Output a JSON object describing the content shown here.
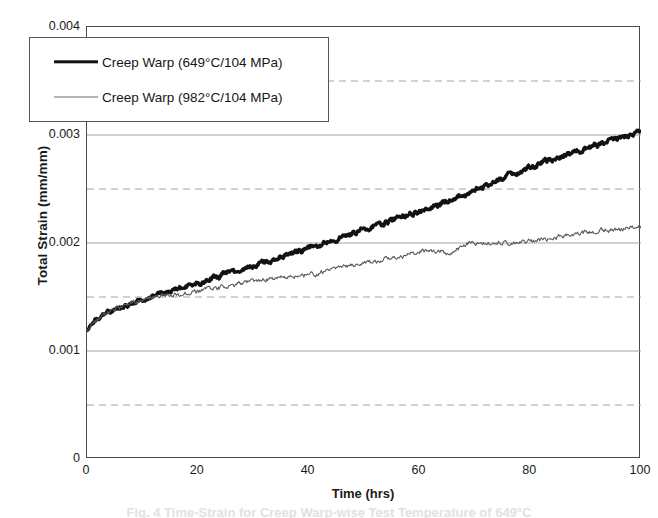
{
  "chart_data": {
    "type": "line",
    "title": "",
    "xlabel": "Time (hrs)",
    "ylabel": "Total Strain (mm/mm)",
    "xlim": [
      0,
      100
    ],
    "ylim": [
      0,
      0.004
    ],
    "xticks": [
      "0",
      "20",
      "40",
      "60",
      "80",
      "100"
    ],
    "xtick_values": [
      0,
      20,
      40,
      60,
      80,
      100
    ],
    "yticks": [
      "0",
      "0.001",
      "0.002",
      "0.003",
      "0.004"
    ],
    "ytick_values": [
      0,
      0.001,
      0.002,
      0.003,
      0.004
    ],
    "minor_gridlines_y": [
      0.0005,
      0.0015,
      0.0025,
      0.0035
    ],
    "grid": true,
    "grid_major_style": "solid",
    "grid_minor_style": "dashed",
    "grid_color": "#9a9a9a",
    "legend_position": "upper-left-inside",
    "series": [
      {
        "name": "Creep Warp (649°C/104 MPa)",
        "color": "#121212",
        "width": 3.4,
        "x": [
          0,
          1,
          2,
          3,
          4,
          5,
          6,
          7,
          8,
          9,
          10,
          12,
          14,
          16,
          18,
          20,
          23,
          26,
          29,
          32,
          35,
          38,
          41,
          44,
          47,
          50,
          53,
          56,
          59,
          62,
          65,
          68,
          71,
          74,
          77,
          80,
          83,
          86,
          89,
          92,
          95,
          97,
          99,
          100
        ],
        "y": [
          0.00119,
          0.00126,
          0.0013,
          0.00133,
          0.00136,
          0.00138,
          0.0014,
          0.00142,
          0.00144,
          0.00146,
          0.00148,
          0.00151,
          0.00154,
          0.00157,
          0.0016,
          0.00163,
          0.00168,
          0.00173,
          0.00177,
          0.00182,
          0.00187,
          0.00192,
          0.00197,
          0.00202,
          0.00207,
          0.00212,
          0.00218,
          0.00223,
          0.00228,
          0.00233,
          0.00239,
          0.00244,
          0.00251,
          0.00258,
          0.00264,
          0.0027,
          0.00276,
          0.00281,
          0.00286,
          0.00291,
          0.00296,
          0.00299,
          0.00302,
          0.00303
        ]
      },
      {
        "name": "Creep Warp (982°C/104 MPa)",
        "color": "#5a5a5a",
        "width": 1.1,
        "x": [
          0,
          1,
          2,
          3,
          4,
          5,
          6,
          7,
          8,
          9,
          10,
          12,
          14,
          16,
          18,
          20,
          23,
          26,
          29,
          32,
          35,
          38,
          41,
          44,
          47,
          50,
          53,
          56,
          59,
          61,
          63,
          65,
          67,
          68,
          70,
          73,
          76,
          79,
          82,
          85,
          88,
          91,
          94,
          97,
          100
        ],
        "y": [
          0.00119,
          0.00126,
          0.0013,
          0.00133,
          0.00136,
          0.00138,
          0.0014,
          0.00142,
          0.00144,
          0.00146,
          0.00148,
          0.0015,
          0.00152,
          0.00152,
          0.00153,
          0.00155,
          0.00158,
          0.00161,
          0.00164,
          0.00166,
          0.00168,
          0.00169,
          0.00171,
          0.00175,
          0.00179,
          0.00182,
          0.00184,
          0.00187,
          0.0019,
          0.00193,
          0.00192,
          0.00191,
          0.00194,
          0.00199,
          0.002,
          0.002,
          0.00201,
          0.00201,
          0.00203,
          0.00206,
          0.00208,
          0.0021,
          0.00212,
          0.00213,
          0.00215
        ]
      }
    ],
    "noise_amplitude": 1.75e-05
  },
  "caption": {
    "cropped_text": "Fig. 4  Time-Strain for Creep Warp-wise Test Temperature of 649°C"
  }
}
